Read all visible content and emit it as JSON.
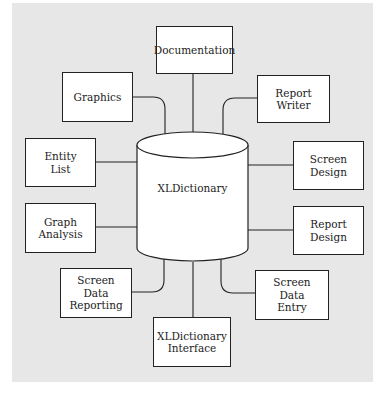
{
  "diagram": {
    "center": {
      "label": "XLDictionary",
      "shape": "cylinder"
    },
    "nodes": [
      {
        "id": "documentation",
        "label": "Documentation"
      },
      {
        "id": "graphics",
        "label": "Graphics"
      },
      {
        "id": "report-writer",
        "label": "Report\nWriter"
      },
      {
        "id": "entity-list",
        "label": "Entity\nList"
      },
      {
        "id": "screen-design",
        "label": "Screen\nDesign"
      },
      {
        "id": "graph-analysis",
        "label": "Graph\nAnalysis"
      },
      {
        "id": "report-design",
        "label": "Report\nDesign"
      },
      {
        "id": "screen-data-reporting",
        "label": "Screen\nData\nReporting"
      },
      {
        "id": "screen-data-entry",
        "label": "Screen\nData\nEntry"
      },
      {
        "id": "xldictionary-interface",
        "label": "XLDictionary\nInterface"
      }
    ],
    "edges": [
      [
        "documentation",
        "XLDictionary"
      ],
      [
        "graphics",
        "XLDictionary"
      ],
      [
        "report-writer",
        "XLDictionary"
      ],
      [
        "entity-list",
        "XLDictionary"
      ],
      [
        "screen-design",
        "XLDictionary"
      ],
      [
        "graph-analysis",
        "XLDictionary"
      ],
      [
        "report-design",
        "XLDictionary"
      ],
      [
        "screen-data-reporting",
        "XLDictionary"
      ],
      [
        "screen-data-entry",
        "XLDictionary"
      ],
      [
        "xldictionary-interface",
        "XLDictionary"
      ]
    ],
    "colors": {
      "background": "#e7e7e7",
      "box_fill": "#ffffff",
      "stroke": "#222222"
    }
  }
}
